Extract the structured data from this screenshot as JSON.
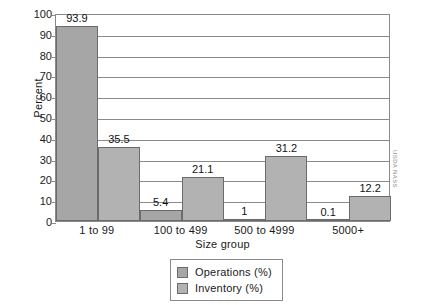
{
  "chart_data": {
    "type": "bar",
    "title": "",
    "xlabel": "Size group",
    "ylabel": "Percent",
    "ylim": [
      0,
      100
    ],
    "ytick_step": 10,
    "yticks": [
      100,
      90,
      80,
      70,
      60,
      50,
      40,
      30,
      20,
      10,
      0
    ],
    "grid": true,
    "legend_position": "bottom-center",
    "categories": [
      "1 to 99",
      "100 to 499",
      "500 to 4999",
      "5000+"
    ],
    "series": [
      {
        "name": "Operations (%)",
        "color": "#a6a6a6",
        "values": [
          93.9,
          5.4,
          1,
          0.1
        ],
        "labels": [
          "93.9",
          "5.4",
          "1",
          "0.1"
        ]
      },
      {
        "name": "Inventory (%)",
        "color": "#b2b2b2",
        "values": [
          35.5,
          21.1,
          31.2,
          12.2
        ],
        "labels": [
          "35.5",
          "21.1",
          "31.2",
          "12.2"
        ]
      }
    ],
    "credit": "USDA NASS"
  }
}
